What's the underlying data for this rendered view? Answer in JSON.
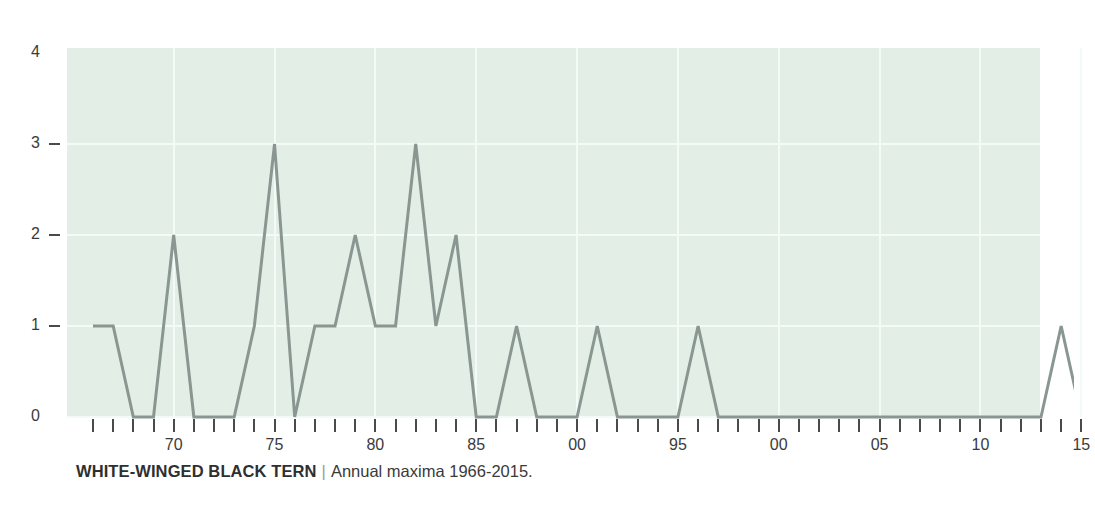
{
  "caption": {
    "species": "WHITE-WINGED BLACK TERN",
    "separator": "|",
    "subtitle": "Annual maxima 1966-2015."
  },
  "colors": {
    "plot_background": "#e3efe6",
    "gridline": "#f4faf5",
    "line": "#8a9691",
    "axis_text": "#3b3b3b",
    "tick": "#4a4a4a",
    "page_background": "#ffffff"
  },
  "chart_data": {
    "type": "line",
    "title": "WHITE-WINGED BLACK TERN",
    "subtitle": "Annual maxima 1966-2015.",
    "xlabel": "",
    "ylabel": "",
    "ylim": [
      0,
      4
    ],
    "xlim": [
      1966,
      2015
    ],
    "grid": true,
    "legend": null,
    "y_ticks": [
      0,
      1,
      2,
      3,
      4
    ],
    "y_tick_labels": [
      "0",
      "1",
      "2",
      "3",
      "4"
    ],
    "x_tick_labels": [
      {
        "year": 1970,
        "label": "70"
      },
      {
        "year": 1975,
        "label": "75"
      },
      {
        "year": 1980,
        "label": "80"
      },
      {
        "year": 1985,
        "label": "85"
      },
      {
        "year": 1990,
        "label": "00"
      },
      {
        "year": 1995,
        "label": "95"
      },
      {
        "year": 2000,
        "label": "00"
      },
      {
        "year": 2005,
        "label": "05"
      },
      {
        "year": 2010,
        "label": "10"
      },
      {
        "year": 2015,
        "label": "15"
      }
    ],
    "x": [
      1966,
      1967,
      1968,
      1969,
      1970,
      1971,
      1972,
      1973,
      1974,
      1975,
      1976,
      1977,
      1978,
      1979,
      1980,
      1981,
      1982,
      1983,
      1984,
      1985,
      1986,
      1987,
      1988,
      1989,
      1990,
      1991,
      1992,
      1993,
      1994,
      1995,
      1996,
      1997,
      1998,
      1999,
      2000,
      2001,
      2002,
      2003,
      2004,
      2005,
      2006,
      2007,
      2008,
      2009,
      2010,
      2011,
      2012,
      2013,
      2014,
      2015
    ],
    "values": [
      1,
      1,
      0,
      0,
      2,
      0,
      0,
      0,
      1,
      3,
      0,
      1,
      1,
      2,
      1,
      1,
      3,
      1,
      2,
      0,
      0,
      1,
      0,
      0,
      0,
      1,
      0,
      0,
      0,
      0,
      1,
      0,
      0,
      0,
      0,
      0,
      0,
      0,
      0,
      0,
      0,
      0,
      0,
      0,
      0,
      0,
      0,
      0,
      1,
      0
    ],
    "series": [
      {
        "name": "Annual maxima",
        "values": [
          1,
          1,
          0,
          0,
          2,
          0,
          0,
          0,
          1,
          3,
          0,
          1,
          1,
          2,
          1,
          1,
          3,
          1,
          2,
          0,
          0,
          1,
          0,
          0,
          0,
          1,
          0,
          0,
          0,
          0,
          1,
          0,
          0,
          0,
          0,
          0,
          0,
          0,
          0,
          0,
          0,
          0,
          0,
          0,
          0,
          0,
          0,
          0,
          1,
          0
        ]
      }
    ]
  }
}
